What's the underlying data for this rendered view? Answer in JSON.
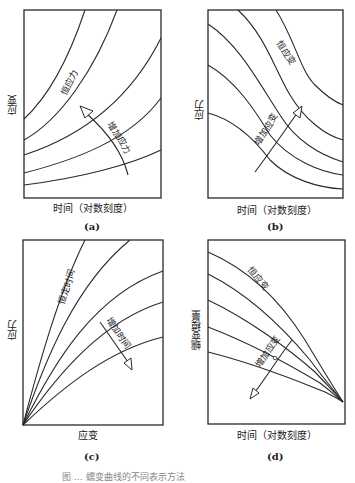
{
  "figure": {
    "caption": "图 … 蠕变曲线的不同表示方法",
    "panels": [
      {
        "id": "a",
        "label": "(a)",
        "xlabel": "时间（对数刻度）",
        "ylabel": "应变",
        "curve_label": "恒应力",
        "arrow_label": "增加应力",
        "curve_count": 5,
        "description": "Strain vs log time, family of rising curves at constant stress; arrow points toward increasing stress (upward)"
      },
      {
        "id": "b",
        "label": "(b)",
        "xlabel": "时间（对数刻度）",
        "ylabel": "应力",
        "curve_label": "恒应变",
        "arrow_label": "增加应变",
        "curve_count": 5,
        "description": "Stress vs log time, family of falling S-shaped curves at constant strain; arrow points toward increasing strain"
      },
      {
        "id": "c",
        "label": "(c)",
        "xlabel": "应变",
        "ylabel": "应力",
        "curve_label": "恒定时间",
        "arrow_label": "增加时间",
        "curve_count": 5,
        "description": "Isochronous stress-strain curves fanning from origin; arrow points toward increasing time (downward)"
      },
      {
        "id": "d",
        "label": "(d)",
        "xlabel": "时间（对数刻度）",
        "ylabel": "蠕变模量",
        "curve_label": "恒应变",
        "arrow_label": "增加应变",
        "curve_count": 5,
        "description": "Creep modulus vs log time, curves converge at right; arrow points toward increasing strain (downward-left)"
      }
    ]
  }
}
